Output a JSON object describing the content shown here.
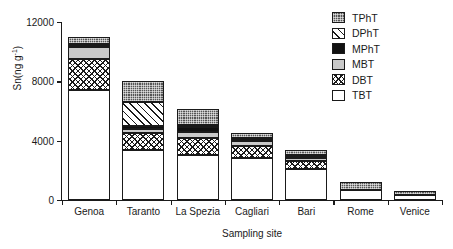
{
  "chart_data": {
    "type": "bar",
    "subtype": "stacked-bar",
    "title": "",
    "xlabel": "Sampling site",
    "ylabel": "Sn(ng g⁻¹)",
    "ylabel_parts": {
      "main": "Sn(ng g",
      "sup": "-1",
      "tail": ")"
    },
    "categories": [
      "Genoa",
      "Taranto",
      "La Spezia",
      "Cagliari",
      "Bari",
      "Rome",
      "Venice"
    ],
    "ylim": [
      0,
      12000
    ],
    "yticks": [
      0,
      4000,
      8000,
      12000
    ],
    "ytick_labels": [
      "0",
      "4000",
      "8000",
      "12000"
    ],
    "grid": false,
    "legend_position": "top-right",
    "stack_order_bottom_to_top": [
      "TBT",
      "DBT",
      "MBT",
      "MPhT",
      "DPhT",
      "TPhT"
    ],
    "series": [
      {
        "name": "TBT",
        "pattern": "white",
        "values": [
          7400,
          3400,
          3050,
          2850,
          2100,
          700,
          350
        ]
      },
      {
        "name": "DBT",
        "pattern": "crosshatch",
        "values": [
          2100,
          1100,
          1150,
          800,
          550,
          0,
          0
        ]
      },
      {
        "name": "MBT",
        "pattern": "light-gray",
        "values": [
          800,
          300,
          400,
          350,
          150,
          0,
          0
        ]
      },
      {
        "name": "MPhT",
        "pattern": "solid-black",
        "values": [
          100,
          200,
          300,
          100,
          150,
          0,
          0
        ]
      },
      {
        "name": "DPhT",
        "pattern": "diagonal",
        "values": [
          150,
          1600,
          150,
          100,
          100,
          0,
          0
        ]
      },
      {
        "name": "TPhT",
        "pattern": "dark-dotted",
        "values": [
          450,
          1450,
          1100,
          350,
          300,
          500,
          250
        ]
      }
    ],
    "totals": [
      11000,
      8050,
      6150,
      4550,
      3350,
      1200,
      600
    ],
    "legend_entries": [
      {
        "label": "TPhT",
        "pattern": "dark-dotted"
      },
      {
        "label": "DPhT",
        "pattern": "diagonal"
      },
      {
        "label": "MPhT",
        "pattern": "solid-black"
      },
      {
        "label": "MBT",
        "pattern": "light-gray"
      },
      {
        "label": "DBT",
        "pattern": "crosshatch"
      },
      {
        "label": "TBT",
        "pattern": "white"
      }
    ],
    "colors": {
      "axis": "#1a1a1a",
      "background": "#ffffff",
      "TBT": "#ffffff",
      "DBT": "#ffffff",
      "MBT": "#c9c9c9",
      "MPhT": "#111111",
      "DPhT": "#ffffff",
      "TPhT": "#555555"
    }
  }
}
